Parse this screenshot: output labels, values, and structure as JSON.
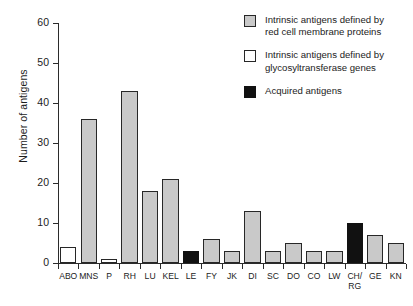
{
  "chart_data": {
    "type": "bar",
    "title": "",
    "xlabel": "",
    "ylabel": "Number of antigens",
    "ylim": [
      0,
      60
    ],
    "yticks": [
      0,
      10,
      20,
      30,
      40,
      50,
      60
    ],
    "ytick_labels": [
      "0",
      "10",
      "20",
      "30",
      "40",
      "50",
      "60"
    ],
    "grid": false,
    "legend_position": "top-right",
    "categories": [
      "ABO",
      "MNS",
      "P",
      "RH",
      "LU",
      "KEL",
      "LE",
      "FY",
      "JK",
      "DI",
      "SC",
      "DO",
      "CO",
      "LW",
      "CH/\nRG",
      "GE",
      "KN"
    ],
    "values": [
      4,
      36,
      1,
      43,
      18,
      21,
      3,
      6,
      3,
      13,
      3,
      5,
      3,
      3,
      10,
      7,
      5
    ],
    "bar_groups": [
      "glycosyltransferase",
      "membrane",
      "glycosyltransferase",
      "membrane",
      "membrane",
      "membrane",
      "acquired",
      "membrane",
      "membrane",
      "membrane",
      "membrane",
      "membrane",
      "membrane",
      "membrane",
      "acquired",
      "membrane",
      "membrane"
    ],
    "series": [
      {
        "name": "Intrinsic antigens defined by red cell membrane proteins",
        "fill": "gray",
        "color": "#c9c9c9",
        "points": [
          {
            "category": "MNS",
            "value": 36
          },
          {
            "category": "RH",
            "value": 43
          },
          {
            "category": "LU",
            "value": 18
          },
          {
            "category": "KEL",
            "value": 21
          },
          {
            "category": "FY",
            "value": 6
          },
          {
            "category": "JK",
            "value": 3
          },
          {
            "category": "DI",
            "value": 13
          },
          {
            "category": "SC",
            "value": 3
          },
          {
            "category": "DO",
            "value": 5
          },
          {
            "category": "CO",
            "value": 3
          },
          {
            "category": "LW",
            "value": 3
          },
          {
            "category": "GE",
            "value": 7
          },
          {
            "category": "KN",
            "value": 5
          }
        ]
      },
      {
        "name": "Intrinsic antigens defined by glycosyltransferase genes",
        "fill": "white",
        "color": "#ffffff",
        "points": [
          {
            "category": "ABO",
            "value": 4
          },
          {
            "category": "P",
            "value": 1
          }
        ]
      },
      {
        "name": "Acquired antigens",
        "fill": "black",
        "color": "#111111",
        "points": [
          {
            "category": "LE",
            "value": 3
          },
          {
            "category": "CH/RG",
            "value": 10
          }
        ]
      }
    ]
  },
  "legend": {
    "entries": [
      {
        "swatch": "gray",
        "label": "Intrinsic antigens defined by\nred cell membrane proteins"
      },
      {
        "swatch": "white",
        "label": "Intrinsic antigens defined by\nglycosyltransferase genes"
      },
      {
        "swatch": "black",
        "label": "Acquired antigens"
      }
    ]
  },
  "axes": {
    "y_title": "Number of antigens"
  }
}
